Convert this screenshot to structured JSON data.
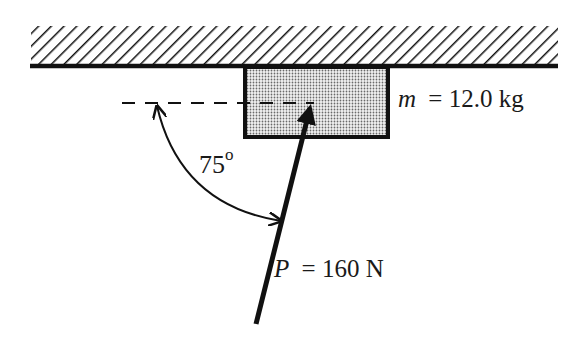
{
  "diagram": {
    "type": "free-body / force diagram",
    "ceiling": {
      "label": "fixed surface (hatched)"
    },
    "block": {
      "mass_symbol": "m",
      "mass_equals": "= 12.0 kg",
      "fill": "#d0d0d0"
    },
    "angle": {
      "value": "75",
      "unit_sup": "o"
    },
    "force": {
      "symbol": "P",
      "equals": "= 160 N"
    },
    "colors": {
      "stroke": "#111111",
      "text": "#1a1a1a"
    }
  }
}
